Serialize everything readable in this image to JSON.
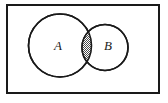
{
  "figure": {
    "name": "venn-diagram-two-sets-intersection-shaded",
    "type": "venn-diagram",
    "background_color": "#ffffff",
    "stroke_color": "#1a1a1a"
  },
  "universe_frame": {
    "label": "",
    "x": 6,
    "y": 4,
    "width": 154,
    "height": 90,
    "stroke_width": 2,
    "stroke_color": "#1a1a1a",
    "fill_color": "#ffffff"
  },
  "sets": [
    {
      "label": "A",
      "name": "circle-a",
      "cx": 60,
      "cy": 45.5,
      "r": 31.5,
      "stroke_width": 1.6,
      "stroke_color": "#1a1a1a",
      "fill_color": "#ffffff",
      "label_x": 58,
      "label_y": 47
    },
    {
      "label": "B",
      "name": "circle-b",
      "cx": 105,
      "cy": 47.5,
      "r": 23,
      "stroke_width": 1.6,
      "stroke_color": "#1a1a1a",
      "fill_color": "#ffffff",
      "label_x": 108,
      "label_y": 47
    }
  ],
  "intersection": {
    "name": "intersection-region",
    "label": "",
    "shaded": true,
    "fill_pattern": "stipple-dots",
    "pattern_color": "#3a3a3a",
    "pattern_background": "#ffffff",
    "approx_bounds": {
      "x": 82,
      "y": 32,
      "width": 10,
      "height": 32
    }
  }
}
